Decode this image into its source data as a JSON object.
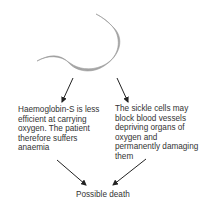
{
  "diagram": {
    "shape": "sickle-cell",
    "shape_color": "#a6a6a6",
    "arrow_color": "#222222",
    "left_outcome": "Haemoglobin-S  is less efficient at carrying oxygen. The patient therefore suffers anaemia",
    "right_outcome": "The sickle cells may block blood vessels depriving organs of oxygen and permanently damaging them",
    "final_outcome": "Possible death"
  }
}
